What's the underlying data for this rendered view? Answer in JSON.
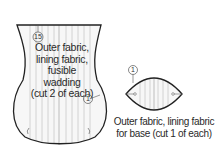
{
  "diagram": {
    "type": "sewing-pattern",
    "pieces": [
      {
        "id": "body",
        "label_lines": [
          "Outer fabric,",
          "lining fabric,",
          "fusible",
          "wadding",
          "(cut 2 of each)"
        ],
        "seam_allowance_top": "15",
        "seam_allowance_side": "1"
      },
      {
        "id": "base",
        "label_lines": [
          "Outer fabric, lining fabric",
          "for base (cut 1 of each)"
        ],
        "seam_allowance": "1"
      }
    ],
    "colors": {
      "outline": "#222222",
      "grain_lines": "#c8c8c8",
      "fill": "#f4f4f4"
    }
  }
}
